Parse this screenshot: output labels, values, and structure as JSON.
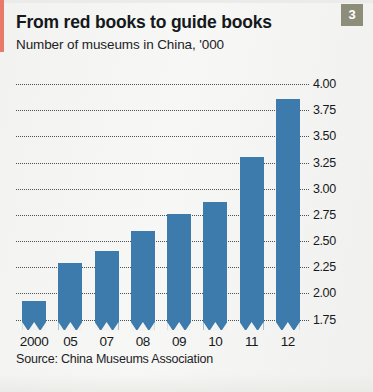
{
  "badge": {
    "number": "3",
    "color": "#8d8d7a"
  },
  "header": {
    "title": "From red books to guide books",
    "subtitle": "Number of museums in China, '000"
  },
  "footer": {
    "source": "Source: China Museums Association"
  },
  "chart_data": {
    "type": "bar",
    "title": "From red books to guide books",
    "subtitle": "Number of museums in China, '000",
    "xlabel": "",
    "ylabel": "",
    "categories": [
      "2000",
      "05",
      "07",
      "08",
      "09",
      "10",
      "11",
      "12"
    ],
    "values": [
      1.93,
      2.29,
      2.4,
      2.6,
      2.76,
      2.87,
      3.3,
      3.86
    ],
    "ylim": [
      1.65,
      4.0
    ],
    "yticks": [
      "4.00",
      "3.75",
      "3.50",
      "3.25",
      "3.00",
      "2.75",
      "2.50",
      "2.25",
      "2.00",
      "1.75"
    ],
    "ytick_values": [
      4.0,
      3.75,
      3.5,
      3.25,
      3.0,
      2.75,
      2.5,
      2.25,
      2.0,
      1.75
    ],
    "grid": true,
    "axis_truncated": true,
    "legend": "none",
    "bar_color": "#3c7bac",
    "source": "Source: China Museums Association"
  }
}
